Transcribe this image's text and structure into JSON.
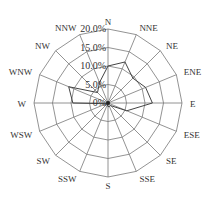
{
  "chart_data": {
    "type": "radar",
    "title": "",
    "directions": [
      "N",
      "NNE",
      "NE",
      "ENE",
      "E",
      "ESE",
      "SE",
      "SSE",
      "S",
      "SSW",
      "SW",
      "WSW",
      "W",
      "WNW",
      "NW",
      "NNW"
    ],
    "series": [
      {
        "name": "wind frequency",
        "values": [
          10.0,
          12.0,
          9.5,
          11.0,
          12.0,
          5.5,
          1.0,
          1.0,
          1.0,
          0.5,
          0.5,
          0.5,
          9.5,
          11.5,
          4.0,
          6.0
        ]
      }
    ],
    "radial_ticks": [
      0,
      5,
      10,
      15,
      20
    ],
    "radial_tick_labels": [
      "0%",
      "5.0%",
      "10.0%",
      "15.0%",
      "20.0%"
    ],
    "rlim": [
      0,
      20
    ],
    "grid": true,
    "grid_color": "#777777",
    "line_color": "#444444"
  }
}
